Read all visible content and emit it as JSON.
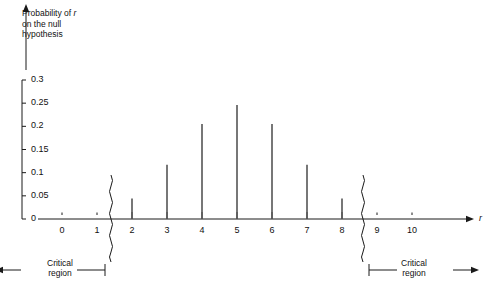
{
  "chart_data": {
    "type": "bar",
    "title": "",
    "subtitle": "",
    "ylabel_lines": [
      "Probability of r",
      "on the null",
      "hypothesis"
    ],
    "ylabel_italic_token": "r",
    "xlabel": "r",
    "x": [
      0,
      1,
      2,
      3,
      4,
      5,
      6,
      7,
      8,
      9,
      10
    ],
    "categories": [
      "0",
      "1",
      "2",
      "3",
      "4",
      "5",
      "6",
      "7",
      "8",
      "9",
      "10"
    ],
    "values": [
      0.001,
      0.01,
      0.044,
      0.117,
      0.205,
      0.246,
      0.205,
      0.117,
      0.044,
      0.01,
      0.001
    ],
    "drawn_bars_x": [
      2,
      3,
      4,
      5,
      6,
      7,
      8
    ],
    "drawn_bars_values": [
      0.044,
      0.117,
      0.205,
      0.246,
      0.205,
      0.117,
      0.044
    ],
    "ylim": [
      0,
      0.3
    ],
    "xlim": [
      0,
      10
    ],
    "ytick_values": [
      0,
      0.05,
      0.1,
      0.15,
      0.2,
      0.25,
      0.3
    ],
    "ytick_labels": [
      "0",
      "0.05",
      "0.1",
      "0.15",
      "0.2",
      "0.25",
      "0.3"
    ],
    "xtick_labels": [
      "0",
      "1",
      "2",
      "3",
      "4",
      "5",
      "6",
      "7",
      "8",
      "9",
      "10"
    ],
    "grid": false,
    "legend": null,
    "axis_breaks": [
      {
        "name": "left-axis-break",
        "between": [
          1,
          2
        ],
        "position_x": 1.4
      },
      {
        "name": "right-axis-break",
        "between": [
          8,
          9
        ],
        "position_x": 8.6
      }
    ],
    "annotations": [
      {
        "name": "left-critical-region",
        "text": "Critical\nregion",
        "direction": "left",
        "boundary_x": 1.4
      },
      {
        "name": "right-critical-region",
        "text": "Critical\nregion",
        "direction": "right",
        "boundary_x": 8.6
      }
    ],
    "bar_color": "#555555",
    "axis_color": "#1a1a1a"
  },
  "annotations": {
    "critical_region_text": "Critical\nregion"
  },
  "axes": {
    "x_axis_tip_label": "r"
  }
}
